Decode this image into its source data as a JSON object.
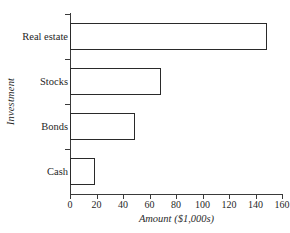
{
  "chart_data": {
    "type": "bar",
    "orientation": "horizontal",
    "title": "",
    "xlabel": "Amount ($1,000s)",
    "ylabel": "Investment",
    "categories": [
      "Real estate",
      "Stocks",
      "Bonds",
      "Cash"
    ],
    "values": [
      149,
      69,
      49,
      19
    ],
    "xlim": [
      0,
      160
    ],
    "xticks": [
      0,
      20,
      40,
      60,
      80,
      100,
      120,
      140,
      160
    ],
    "xtick_labels": [
      "0",
      "20",
      "40",
      "60",
      "80",
      "100",
      "120",
      "140",
      "160"
    ],
    "grid": false,
    "legend": false,
    "series": [
      {
        "name": "Amount",
        "values": [
          149,
          69,
          49,
          19
        ]
      }
    ],
    "style": {
      "bar_fill": "#ffffff",
      "bar_border": "#2a2a2a",
      "axis_color": "#3a3a3a",
      "text_color": "#1f1f1f",
      "background": "#ffffff"
    }
  }
}
